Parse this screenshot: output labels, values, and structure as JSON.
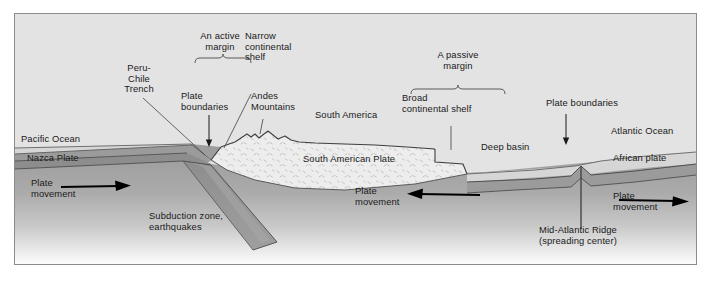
{
  "figure": {
    "type": "geological-cross-section",
    "colors": {
      "background": "#e3e3e3",
      "frame_border": "#8b8b8b",
      "ocean_water": "#d2d2d2",
      "oceanic_crust": "#9a9a9a",
      "oceanic_crust_dark": "#8a8a8a",
      "mantle_top": "#a0a0a0",
      "mantle_bottom": "#ffffff",
      "continent_fill": "#ececec",
      "text": "#1a1a1a",
      "leader_line": "#4a4a4a",
      "arrow": "#000000"
    }
  },
  "labels": {
    "peru_chile_trench": "Peru-\nChile\nTrench",
    "an_active_margin": "An active\nmargin",
    "narrow_continental_shelf": "Narrow\ncontinental\nshelf",
    "plate_boundaries_left": "Plate\nboundaries",
    "andes_mountains": "Andes\nMountains",
    "south_america": "South America",
    "a_passive_margin": "A passive\nmargin",
    "broad_continental_shelf": "Broad\ncontinental shelf",
    "plate_boundaries_right": "Plate boundaries",
    "pacific_ocean": "Pacific Ocean",
    "atlantic_ocean": "Atlantic Ocean",
    "nazca_plate": "Nazca Plate",
    "south_american_plate": "South American Plate",
    "deep_basin": "Deep basin",
    "african_plate": "African plate",
    "plate_movement_left": "Plate\nmovement",
    "plate_movement_center": "Plate\nmovement",
    "plate_movement_right": "Plate\nmovement",
    "subduction_zone": "Subduction zone,\nearthquakes",
    "mid_atlantic_ridge": "Mid-Atlantic Ridge\n(spreading center)"
  },
  "annotations": {
    "brackets": [
      "An active margin",
      "A passive margin"
    ],
    "arrows": [
      {
        "name": "plate-movement-left",
        "direction": "right"
      },
      {
        "name": "plate-movement-center",
        "direction": "left"
      },
      {
        "name": "plate-movement-right",
        "direction": "right"
      },
      {
        "name": "plate-boundaries-left-pointer",
        "direction": "down"
      },
      {
        "name": "plate-boundaries-right-pointer",
        "direction": "down"
      }
    ],
    "leader_lines": [
      "Peru-Chile Trench",
      "Narrow continental shelf",
      "Andes Mountains",
      "Broad continental shelf",
      "Mid-Atlantic Ridge"
    ]
  }
}
